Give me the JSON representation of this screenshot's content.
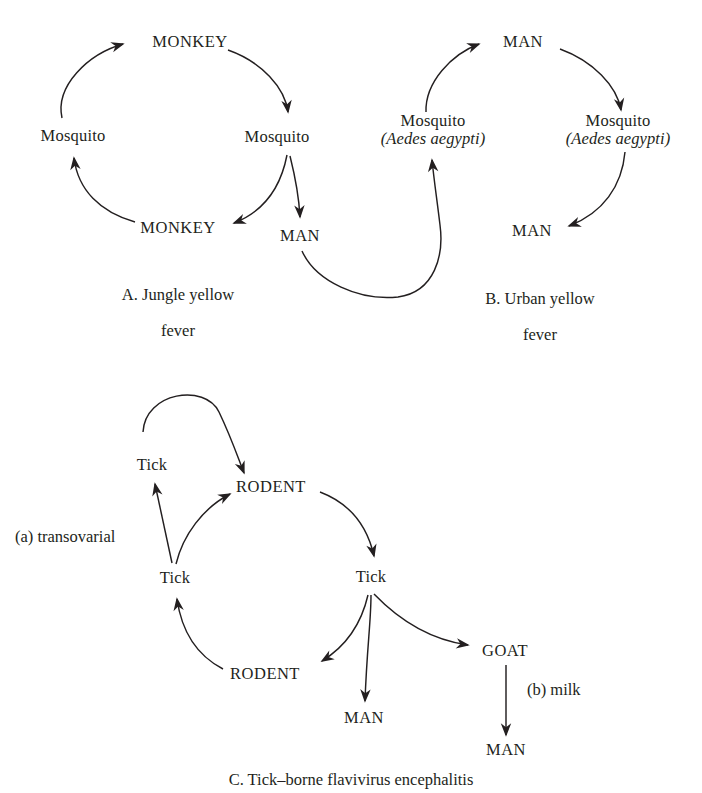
{
  "figure": {
    "background_color": "#ffffff",
    "ink_color": "#231f20"
  },
  "panels": [
    {
      "id": "A",
      "caption": "A. Jungle yellow\nfever",
      "caption_line1": "A. Jungle yellow",
      "caption_line2": "fever",
      "nodes": [
        {
          "key": "monkey_top",
          "label": "MONKEY",
          "style": "upper",
          "x": 190,
          "y": 42
        },
        {
          "key": "mosquito_right",
          "label": "Mosquito",
          "style": "mixed",
          "x": 277,
          "y": 137
        },
        {
          "key": "mosquito_left",
          "label": "Mosquito",
          "style": "mixed",
          "x": 73,
          "y": 136
        },
        {
          "key": "monkey_bottom",
          "label": "MONKEY",
          "style": "upper",
          "x": 178,
          "y": 228
        },
        {
          "key": "man",
          "label": "MAN",
          "style": "upper",
          "x": 300,
          "y": 236
        }
      ],
      "edges": [
        {
          "from": "mosquito_left",
          "to": "monkey_top"
        },
        {
          "from": "monkey_top",
          "to": "mosquito_right"
        },
        {
          "from": "mosquito_right",
          "to": "monkey_bottom"
        },
        {
          "from": "monkey_bottom",
          "to": "mosquito_left"
        },
        {
          "from": "mosquito_right",
          "to": "man"
        }
      ]
    },
    {
      "id": "B",
      "caption": "B. Urban yellow\nfever",
      "caption_line1": "B. Urban yellow",
      "caption_line2": "fever",
      "nodes": [
        {
          "key": "man_top",
          "label": "MAN",
          "style": "upper",
          "x": 523,
          "y": 42,
          "sci": null
        },
        {
          "key": "mosquito_right",
          "label": "Mosquito",
          "style": "mixed",
          "x": 618,
          "y": 130,
          "sci": "(Aedes aegypti)"
        },
        {
          "key": "mosquito_left",
          "label": "Mosquito",
          "style": "mixed",
          "x": 433,
          "y": 130,
          "sci": "(Aedes aegypti)"
        },
        {
          "key": "man_bottom",
          "label": "MAN",
          "style": "upper",
          "x": 532,
          "y": 231,
          "sci": null
        }
      ],
      "edges": [
        {
          "from": "mosquito_left",
          "to": "man_top"
        },
        {
          "from": "man_top",
          "to": "mosquito_right"
        },
        {
          "from": "mosquito_right",
          "to": "man_bottom"
        },
        {
          "from": "man_bottom",
          "to": "mosquito_left"
        }
      ]
    },
    {
      "id": "C",
      "caption": "C. Tick–borne flavivirus encephalitis",
      "caption_line1": "C. Tick–borne flavivirus encephalitis",
      "caption_line2": "",
      "annotations": [
        {
          "key": "transovarial",
          "label": "(a) transovarial",
          "x": 15,
          "y": 537
        },
        {
          "key": "milk",
          "label": "(b) milk",
          "x": 527,
          "y": 690
        }
      ],
      "nodes": [
        {
          "key": "tick_upper",
          "label": "Tick",
          "style": "mixed",
          "x": 152,
          "y": 465
        },
        {
          "key": "rodent_top",
          "label": "RODENT",
          "style": "upper",
          "x": 271,
          "y": 487
        },
        {
          "key": "tick_left",
          "label": "Tick",
          "style": "mixed",
          "x": 175,
          "y": 578
        },
        {
          "key": "tick_right",
          "label": "Tick",
          "style": "mixed",
          "x": 371,
          "y": 577
        },
        {
          "key": "rodent_bottom",
          "label": "RODENT",
          "style": "upper",
          "x": 265,
          "y": 674
        },
        {
          "key": "man_center",
          "label": "MAN",
          "style": "upper",
          "x": 364,
          "y": 718
        },
        {
          "key": "goat",
          "label": "GOAT",
          "style": "upper",
          "x": 505,
          "y": 651
        },
        {
          "key": "man_bottom",
          "label": "MAN",
          "style": "upper",
          "x": 506,
          "y": 750
        }
      ],
      "edges": [
        {
          "from": "tick_upper",
          "to": "rodent_top",
          "note": "arc over top"
        },
        {
          "from": "rodent_top",
          "to": "tick_right"
        },
        {
          "from": "tick_right",
          "to": "rodent_bottom"
        },
        {
          "from": "rodent_bottom",
          "to": "tick_left"
        },
        {
          "from": "tick_left",
          "to": "tick_upper",
          "note": "(a) transovarial"
        },
        {
          "from": "tick_left",
          "to": "rodent_top"
        },
        {
          "from": "tick_right",
          "to": "man_center"
        },
        {
          "from": "tick_right",
          "to": "goat"
        },
        {
          "from": "goat",
          "to": "man_bottom",
          "note": "(b) milk"
        }
      ]
    }
  ],
  "bridge_edges": [
    {
      "from": "A.man",
      "to": "B.mosquito_left",
      "note": "jungle to urban cycle link"
    }
  ]
}
